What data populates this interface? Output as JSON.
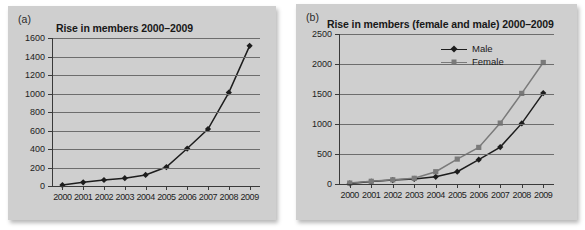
{
  "figure": {
    "background": "#ffffff",
    "panel_background": "#cfcfcf"
  },
  "panels": [
    {
      "key": "a",
      "label": "(a)",
      "title": "Rise in members 2000–2009"
    },
    {
      "key": "b",
      "label": "(b)",
      "title": "Rise in members (female and male) 2000–2009"
    }
  ],
  "legend": {
    "position": "top-right",
    "items": [
      {
        "name": "Male",
        "marker": "diamond",
        "color": "#1d1d1d"
      },
      {
        "name": "Female",
        "marker": "square",
        "color": "#7a7a7a"
      }
    ]
  },
  "chart_data": [
    {
      "type": "line",
      "panel": "a",
      "title": "Rise in members 2000–2009",
      "xlabel": "",
      "ylabel": "",
      "categories": [
        "2000",
        "2001",
        "2002",
        "2003",
        "2004",
        "2005",
        "2006",
        "2007",
        "2008",
        "2009"
      ],
      "values": [
        10,
        40,
        65,
        85,
        120,
        205,
        405,
        615,
        1010,
        1515
      ],
      "series_name": "Members",
      "marker": "diamond",
      "color": "#1d1d1d",
      "ylim": [
        0,
        1600
      ],
      "yticks": [
        0,
        200,
        400,
        600,
        800,
        1000,
        1200,
        1400,
        1600
      ],
      "grid": true,
      "legend": false
    },
    {
      "type": "line",
      "panel": "b",
      "title": "Rise in members (female and male) 2000–2009",
      "xlabel": "",
      "ylabel": "",
      "categories": [
        "2000",
        "2001",
        "2002",
        "2003",
        "2004",
        "2005",
        "2006",
        "2007",
        "2008",
        "2009"
      ],
      "series": [
        {
          "name": "Male",
          "marker": "diamond",
          "color": "#1d1d1d",
          "values": [
            10,
            40,
            65,
            85,
            120,
            205,
            405,
            615,
            1010,
            1515
          ]
        },
        {
          "name": "Female",
          "marker": "square",
          "color": "#7a7a7a",
          "values": [
            15,
            45,
            70,
            95,
            205,
            415,
            610,
            1015,
            1510,
            2025
          ]
        }
      ],
      "ylim": [
        0,
        2500
      ],
      "yticks": [
        0,
        500,
        1000,
        1500,
        2000,
        2500
      ],
      "grid": true,
      "legend": true
    }
  ]
}
